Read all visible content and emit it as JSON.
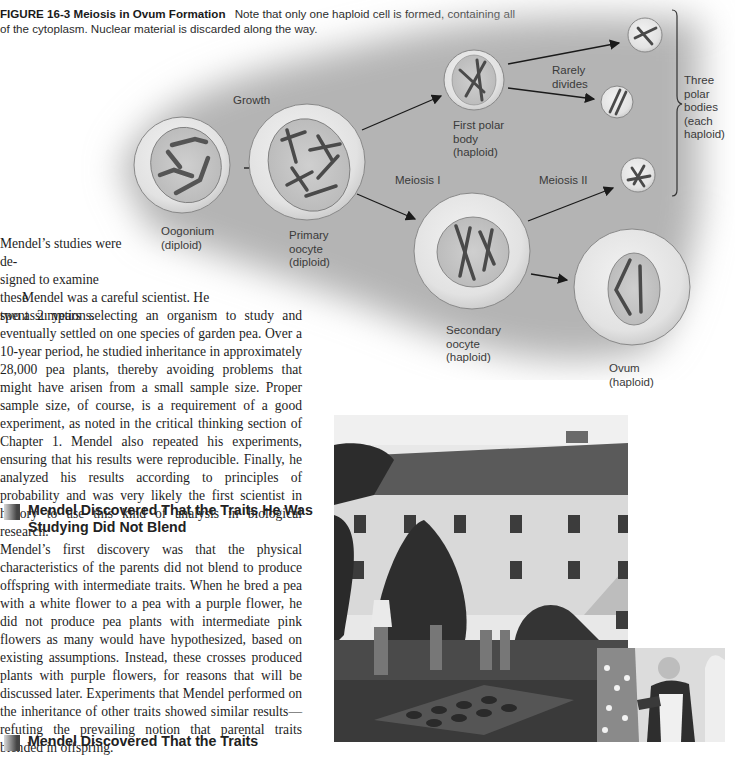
{
  "figure": {
    "label": "FIGURE 16-3",
    "title": "Meiosis in Ovum Formation",
    "caption": "Note that only one haploid cell is formed, containing all of the cytoplasm. Nuclear material is discarded along the way."
  },
  "diagram": {
    "labels": {
      "growth": "Growth",
      "meiosis1": "Meiosis I",
      "meiosis2": "Meiosis II",
      "rarely_divides": "Rarely\ndivides",
      "oogonium": "Oogonium\n(diploid)",
      "primary_oocyte": "Primary\noocyte\n(diploid)",
      "first_polar_body": "First polar\nbody\n(haploid)",
      "secondary_oocyte": "Secondary\noocyte\n(haploid)",
      "ovum": "Ovum\n(haploid)",
      "three_polar_bodies": "Three\npolar\nbodies\n(each\nhaploid)"
    }
  },
  "text": {
    "para1_lines": [
      "Mendel’s studies were de-",
      "signed to examine these",
      "two assumptions."
    ],
    "para2_first": "Mendel was a careful scientist. He",
    "para2": "spent 2 years selecting an organism to study and eventually settled on one species of garden pea. Over a 10-year period, he studied inheritance in approximately 28,000 pea plants, thereby avoiding problems that might have arisen from a small sample size. Proper sample size, of course, is a requirement of a good experiment, as noted in the critical thinking section of Chapter 1. Mendel also repeated his experiments, ensuring that his results were reproducible. Finally, he analyzed his results according to principles of probability and was very likely the first scientist in history to use this kind of analysis in biological research.",
    "heading1": "Mendel Discovered That the Traits He Was Studying Did Not Blend",
    "para3": "Mendel’s first discovery was that the physical characteristics of the parents did not blend to produce offspring with intermediate traits. When he bred a pea with a white flower to a pea with a purple flower, he did not produce pea plants with intermediate pink flowers as many would have hypothesized, based on existing assumptions. Instead, these crosses produced plants with purple flowers, for reasons that will be discussed later. Experiments that Mendel performed on the inheritance of other traits showed similar results—refuting the prevailing notion that parental traits blended in offspring.",
    "heading2_partial": "Mendel Discovered That the Traits"
  }
}
